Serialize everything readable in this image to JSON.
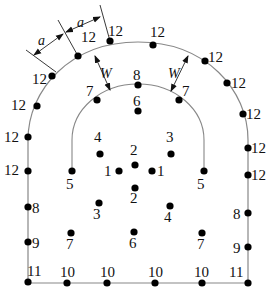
{
  "diagram": {
    "dimension_labels": {
      "a1": "a",
      "a2": "a",
      "w_left": "W",
      "w_right": "W"
    },
    "outer_points": [
      {
        "x": 52,
        "y": 76,
        "label": "12",
        "lx": 32,
        "ly": 84
      },
      {
        "x": 78,
        "y": 56,
        "label": "12",
        "lx": 81,
        "ly": 42
      },
      {
        "x": 110,
        "y": 41,
        "label": "12",
        "lx": 108,
        "ly": 36
      },
      {
        "x": 153,
        "y": 45,
        "label": "12",
        "lx": 150,
        "ly": 37
      },
      {
        "x": 205,
        "y": 61,
        "label": "12",
        "lx": 208,
        "ly": 62
      },
      {
        "x": 227,
        "y": 83,
        "label": "12",
        "lx": 231,
        "ly": 88
      },
      {
        "x": 37,
        "y": 106,
        "label": "12",
        "lx": 11,
        "ly": 110
      },
      {
        "x": 28,
        "y": 137,
        "label": "12",
        "lx": 4,
        "ly": 142
      },
      {
        "x": 28,
        "y": 171,
        "label": "12",
        "lx": 4,
        "ly": 175
      },
      {
        "x": 243,
        "y": 114,
        "label": "12",
        "lx": 246,
        "ly": 119
      },
      {
        "x": 248,
        "y": 148,
        "label": "12",
        "lx": 251,
        "ly": 153
      },
      {
        "x": 248,
        "y": 175,
        "label": "12",
        "lx": 251,
        "ly": 180
      },
      {
        "x": 28,
        "y": 207,
        "label": "8",
        "lx": 32,
        "ly": 213
      },
      {
        "x": 248,
        "y": 213,
        "label": "8",
        "lx": 233,
        "ly": 219
      },
      {
        "x": 28,
        "y": 242,
        "label": "9",
        "lx": 32,
        "ly": 248
      },
      {
        "x": 248,
        "y": 247,
        "label": "9",
        "lx": 233,
        "ly": 253
      },
      {
        "x": 28,
        "y": 282,
        "label": "11",
        "lx": 27,
        "ly": 276
      },
      {
        "x": 248,
        "y": 283,
        "label": "11",
        "lx": 229,
        "ly": 277
      },
      {
        "x": 67,
        "y": 283,
        "label": "10",
        "lx": 60,
        "ly": 277
      },
      {
        "x": 107,
        "y": 283,
        "label": "10",
        "lx": 100,
        "ly": 277
      },
      {
        "x": 155,
        "y": 283,
        "label": "10",
        "lx": 148,
        "ly": 277
      },
      {
        "x": 202,
        "y": 283,
        "label": "10",
        "lx": 194,
        "ly": 277
      }
    ],
    "inner_arc_points": [
      {
        "x": 72,
        "y": 171,
        "label": "5",
        "lx": 66,
        "ly": 189
      },
      {
        "x": 204,
        "y": 171,
        "label": "5",
        "lx": 197,
        "ly": 189
      },
      {
        "x": 97,
        "y": 100,
        "label": "7",
        "lx": 86,
        "ly": 96
      },
      {
        "x": 179,
        "y": 100,
        "label": "7",
        "lx": 182,
        "ly": 96
      },
      {
        "x": 138,
        "y": 85,
        "label": "8",
        "lx": 133,
        "ly": 80
      }
    ],
    "inner_points": [
      {
        "x": 138,
        "y": 111,
        "label": "6",
        "lx": 133,
        "ly": 106
      },
      {
        "x": 100,
        "y": 154,
        "label": "4",
        "lx": 94,
        "ly": 142
      },
      {
        "x": 171,
        "y": 154,
        "label": "3",
        "lx": 166,
        "ly": 142
      },
      {
        "x": 135,
        "y": 165,
        "label": "2",
        "lx": 130,
        "ly": 155
      },
      {
        "x": 119,
        "y": 171,
        "label": "1",
        "lx": 104,
        "ly": 176
      },
      {
        "x": 152,
        "y": 171,
        "label": "1",
        "lx": 157,
        "ly": 176
      },
      {
        "x": 135,
        "y": 188,
        "label": "2",
        "lx": 130,
        "ly": 203
      },
      {
        "x": 99,
        "y": 203,
        "label": "3",
        "lx": 93,
        "ly": 219
      },
      {
        "x": 170,
        "y": 206,
        "label": "4",
        "lx": 164,
        "ly": 222
      },
      {
        "x": 134,
        "y": 232,
        "label": "6",
        "lx": 129,
        "ly": 248
      },
      {
        "x": 71,
        "y": 233,
        "label": "7",
        "lx": 66,
        "ly": 249
      },
      {
        "x": 202,
        "y": 233,
        "label": "7",
        "lx": 197,
        "ly": 249
      }
    ]
  }
}
